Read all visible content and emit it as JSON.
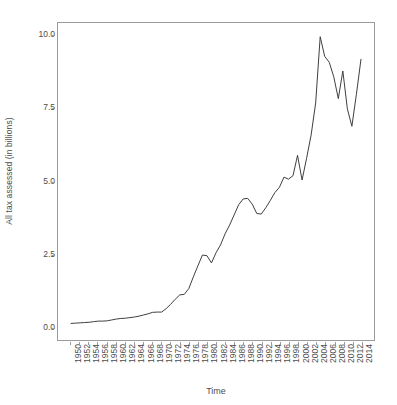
{
  "chart_data": {
    "type": "line",
    "title": "",
    "xlabel": "Time",
    "ylabel": "All tax assessed (in billions)",
    "xlim": [
      1950,
      2014
    ],
    "ylim": [
      0.0,
      10.0
    ],
    "grid": false,
    "legend": "none",
    "line_color": "#3d3d3d",
    "panel_border_color": "#9a9a9a",
    "background_color": "#ffffff",
    "text_color": "#4d4d4d",
    "y_ticks": [
      0.0,
      2.5,
      5.0,
      7.5,
      10.0
    ],
    "y_tick_labels": [
      "0.0",
      "2.5",
      "5.0",
      "7.5",
      "10.0"
    ],
    "x_ticks": [
      1950,
      1952,
      1954,
      1956,
      1958,
      1960,
      1962,
      1964,
      1966,
      1968,
      1970,
      1972,
      1974,
      1976,
      1978,
      1980,
      1982,
      1984,
      1986,
      1988,
      1990,
      1992,
      1994,
      1996,
      1998,
      2000,
      2002,
      2004,
      2006,
      2008,
      2010,
      2012,
      2014
    ],
    "x_tick_labels": [
      "1950",
      "1952",
      "1954",
      "1956",
      "1958",
      "1960",
      "1962",
      "1964",
      "1966",
      "1968",
      "1970",
      "1972",
      "1974",
      "1976",
      "1978",
      "1980",
      "1982",
      "1984",
      "1986",
      "1988",
      "1990",
      "1992",
      "1994",
      "1996",
      "1998",
      "2000",
      "2002",
      "2004",
      "2006",
      "2008",
      "2010",
      "2012",
      "2014"
    ],
    "series": [
      {
        "name": "All tax assessed",
        "x": [
          1950,
          1951,
          1952,
          1953,
          1954,
          1955,
          1956,
          1957,
          1958,
          1959,
          1960,
          1961,
          1962,
          1963,
          1964,
          1965,
          1966,
          1967,
          1968,
          1969,
          1970,
          1971,
          1972,
          1973,
          1974,
          1975,
          1976,
          1977,
          1978,
          1979,
          1980,
          1981,
          1982,
          1983,
          1984,
          1985,
          1986,
          1987,
          1988,
          1989,
          1990,
          1991,
          1992,
          1993,
          1994,
          1995,
          1996,
          1997,
          1998,
          1999,
          2000,
          2001,
          2002,
          2003,
          2004,
          2005,
          2006,
          2007,
          2008,
          2009,
          2010,
          2011,
          2012,
          2013,
          2014
        ],
        "values": [
          0.12,
          0.13,
          0.14,
          0.15,
          0.16,
          0.18,
          0.2,
          0.2,
          0.21,
          0.24,
          0.27,
          0.29,
          0.3,
          0.32,
          0.34,
          0.37,
          0.41,
          0.45,
          0.5,
          0.51,
          0.51,
          0.63,
          0.78,
          0.95,
          1.1,
          1.12,
          1.32,
          1.72,
          2.1,
          2.47,
          2.45,
          2.2,
          2.55,
          2.82,
          3.2,
          3.5,
          3.85,
          4.2,
          4.4,
          4.42,
          4.22,
          3.9,
          3.88,
          4.1,
          4.35,
          4.62,
          4.8,
          5.15,
          5.08,
          5.2,
          5.9,
          5.05,
          5.8,
          6.6,
          7.7,
          9.98,
          9.3,
          9.1,
          8.6,
          7.85,
          8.8,
          7.5,
          6.9,
          8.0,
          9.2
        ]
      }
    ]
  },
  "axes": {
    "y_title": "All tax assessed (in billions)",
    "x_title": "Time"
  }
}
